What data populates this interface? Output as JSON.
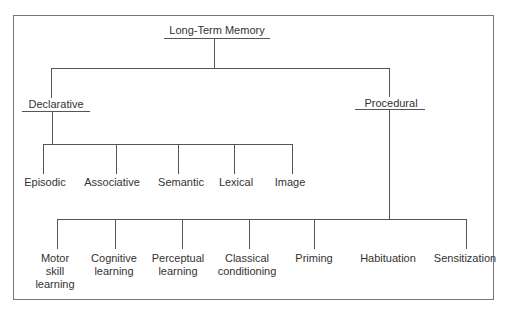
{
  "diagram": {
    "root": {
      "label": "Long-Term Memory"
    },
    "branches": [
      {
        "label": "Declarative",
        "children": [
          "Episodic",
          "Associative",
          "Semantic",
          "Lexical",
          "Image"
        ]
      },
      {
        "label": "Procedural",
        "children": [
          [
            "Motor",
            "skill",
            "learning"
          ],
          [
            "Cognitive",
            "learning"
          ],
          [
            "Perceptual",
            "learning"
          ],
          [
            "Classical",
            "conditioning"
          ],
          [
            "Priming"
          ],
          [
            "Habituation"
          ],
          [
            "Sensitization"
          ]
        ]
      }
    ]
  }
}
